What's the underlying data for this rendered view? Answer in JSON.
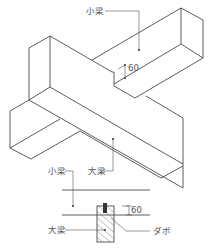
{
  "diagram": {
    "iso": {
      "small_beam_label": "小梁",
      "big_beam_label": "大梁",
      "dim_label": "60"
    },
    "section": {
      "small_beam_label": "小梁",
      "big_beam_label": "大梁",
      "dim_label": "60",
      "dowel_label": "ダボ"
    }
  }
}
